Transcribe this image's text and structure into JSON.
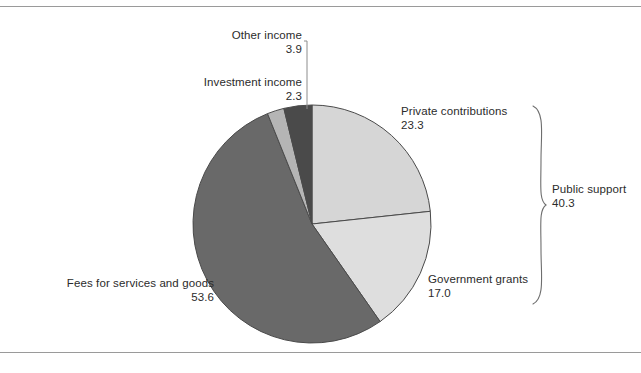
{
  "chart_data": {
    "type": "pie",
    "title": "",
    "subtitle": "",
    "xlabel": "",
    "ylabel": "",
    "legend_position": "none",
    "grid": false,
    "units": "percent",
    "start_angle_deg": 0,
    "direction": "clockwise",
    "categories": [
      "Private contributions",
      "Government grants",
      "Fees for services and goods",
      "Investment income",
      "Other income"
    ],
    "values": [
      23.3,
      17.0,
      53.6,
      2.3,
      3.9
    ],
    "slices": [
      {
        "label": "Private contributions",
        "value": "23.3",
        "color": "#d6d6d6",
        "start_deg": 0.0,
        "end_deg": 83.88
      },
      {
        "label": "Government grants",
        "value": "17.0",
        "color": "#dedede",
        "start_deg": 83.88,
        "end_deg": 145.08
      },
      {
        "label": "Fees for services and goods",
        "value": "53.6",
        "color": "#696969",
        "start_deg": 145.08,
        "end_deg": 338.04
      },
      {
        "label": "Investment income",
        "value": "2.3",
        "color": "#b5b5b5",
        "start_deg": 338.04,
        "end_deg": 346.32
      },
      {
        "label": "Other income",
        "value": "3.9",
        "color": "#4a4a4a",
        "start_deg": 346.32,
        "end_deg": 360.0
      }
    ],
    "annotations": [
      {
        "label": "Public support",
        "value": "40.3",
        "type": "brace-group",
        "groups": [
          "Private contributions",
          "Government grants"
        ]
      }
    ]
  },
  "colors": {
    "frame": "#9a9a9a",
    "outline": "#4a4a4a",
    "leader": "#8c8c8c",
    "brace": "#6e6e6e",
    "text": "#2b2b2b",
    "background": "#ffffff"
  },
  "labels": {
    "other_income": {
      "name": "Other income",
      "value": "3.9"
    },
    "investment_income": {
      "name": "Investment income",
      "value": "2.3"
    },
    "private_contrib": {
      "name": "Private contributions",
      "value": "23.3"
    },
    "gov_grants": {
      "name": "Government grants",
      "value": "17.0"
    },
    "fees": {
      "name": "Fees for services and goods",
      "value": "53.6"
    },
    "public_support": {
      "name": "Public support",
      "value": "40.3"
    }
  }
}
